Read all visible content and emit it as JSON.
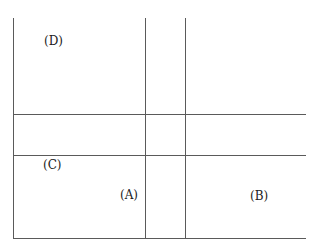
{
  "diagram": {
    "type": "grid-partition",
    "line_color": "#5a5a5a",
    "background": "#ffffff",
    "regions": [
      {
        "id": "D",
        "label": "(D)"
      },
      {
        "id": "C",
        "label": "(C)"
      },
      {
        "id": "A",
        "label": "(A)"
      },
      {
        "id": "B",
        "label": "(B)"
      }
    ]
  }
}
